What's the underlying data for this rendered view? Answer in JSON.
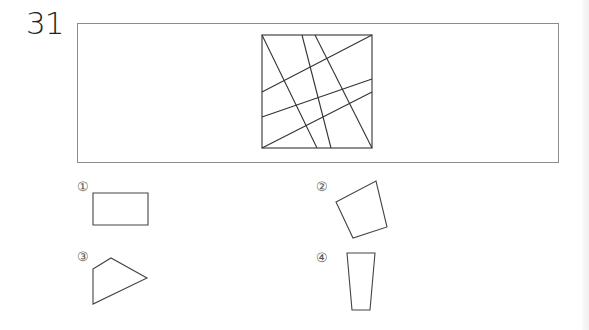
{
  "question": {
    "number": "31"
  },
  "figure": {
    "square": {
      "x1": 262,
      "y1": 35,
      "x2": 372,
      "y2": 148
    },
    "lines": [
      {
        "x1": 262,
        "y1": 35,
        "x2": 317,
        "y2": 148
      },
      {
        "x1": 302,
        "y1": 35,
        "x2": 331,
        "y2": 148
      },
      {
        "x1": 315,
        "y1": 35,
        "x2": 372,
        "y2": 148
      },
      {
        "x1": 262,
        "y1": 92,
        "x2": 372,
        "y2": 35
      },
      {
        "x1": 262,
        "y1": 117,
        "x2": 372,
        "y2": 79
      },
      {
        "x1": 262,
        "y1": 148,
        "x2": 372,
        "y2": 92
      }
    ]
  },
  "options": [
    {
      "label": "①",
      "shape": "rectangle",
      "points": "93,193 148,193 148,225 93,225"
    },
    {
      "label": "②",
      "shape": "quadrilateral",
      "points": "336,202 376,181 387,227 353,238"
    },
    {
      "label": "③",
      "shape": "quadrilateral",
      "points": "93,269 111,258 147,278 93,304"
    },
    {
      "label": "④",
      "shape": "trapezoid",
      "points": "347,253 375,253 370,310 352,310"
    }
  ],
  "colors": {
    "line": "#333333",
    "frame": "#8c8c8c"
  }
}
